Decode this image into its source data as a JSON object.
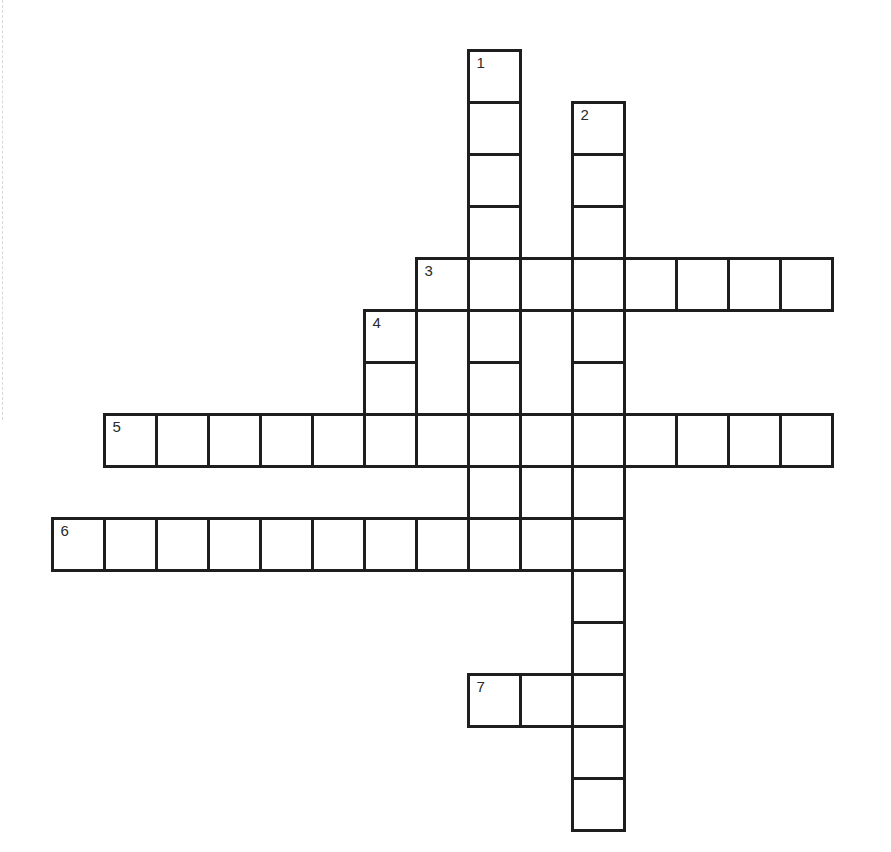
{
  "puzzle": {
    "type": "crossword",
    "cell_size": 52,
    "origin": {
      "x": 52,
      "y": 50
    },
    "clue_numbers": [
      "1",
      "2",
      "3",
      "4",
      "5",
      "6",
      "7"
    ],
    "entries": [
      {
        "number": "1",
        "direction": "down",
        "row": 0,
        "col": 8,
        "length": 10
      },
      {
        "number": "2",
        "direction": "down",
        "row": 1,
        "col": 10,
        "length": 14
      },
      {
        "number": "3",
        "direction": "across",
        "row": 4,
        "col": 7,
        "length": 8
      },
      {
        "number": "4",
        "direction": "down",
        "row": 5,
        "col": 6,
        "length": 2
      },
      {
        "number": "5",
        "direction": "across",
        "row": 7,
        "col": 1,
        "length": 14
      },
      {
        "number": "6",
        "direction": "across",
        "row": 9,
        "col": 0,
        "length": 11
      },
      {
        "number": "7",
        "direction": "across",
        "row": 12,
        "col": 8,
        "length": 3
      }
    ],
    "merged_regions": [
      {
        "row": 5,
        "col": 7,
        "rows": 2
      },
      {
        "row": 5,
        "col": 9,
        "rows": 2
      }
    ],
    "extra_cells": [
      {
        "row": 8,
        "col": 9
      }
    ],
    "colors": {
      "line": "#1e1e1e",
      "background": "#ffffff",
      "number": "#2a2a2a"
    }
  }
}
